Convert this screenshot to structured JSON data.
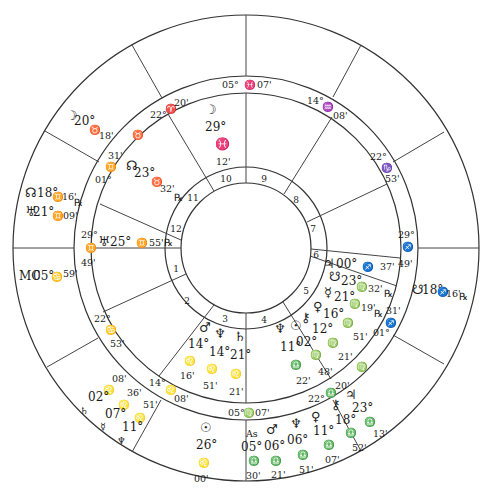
{
  "chart": {
    "center": [
      246,
      248
    ],
    "radii": {
      "outer": 233,
      "sign_ring_outer": 172,
      "sign_ring_inner": 155,
      "house_ring_outer": 81,
      "house_ring_inner": 65
    }
  },
  "outer_cusp_lines": [
    {
      "x1": 246,
      "y1": 15,
      "x2": 246,
      "y2": 76
    },
    {
      "x1": 132,
      "y1": 45,
      "x2": 162,
      "y2": 98
    },
    {
      "x1": 45,
      "y1": 131,
      "x2": 99,
      "y2": 162
    },
    {
      "x1": 13,
      "y1": 248,
      "x2": 74,
      "y2": 248
    },
    {
      "x1": 47,
      "y1": 367,
      "x2": 98,
      "y2": 338
    },
    {
      "x1": 132,
      "y1": 452,
      "x2": 161,
      "y2": 400
    },
    {
      "x1": 246,
      "y1": 481,
      "x2": 246,
      "y2": 420
    },
    {
      "x1": 361,
      "y1": 451,
      "x2": 333,
      "y2": 400
    },
    {
      "x1": 444,
      "y1": 364,
      "x2": 393,
      "y2": 335
    },
    {
      "x1": 479,
      "y1": 248,
      "x2": 418,
      "y2": 248
    },
    {
      "x1": 444,
      "y1": 132,
      "x2": 393,
      "y2": 162
    },
    {
      "x1": 361,
      "y1": 45,
      "x2": 333,
      "y2": 97
    }
  ],
  "inner_cusp_lines": [
    {
      "x1": 246,
      "y1": 93,
      "x2": 246,
      "y2": 183
    },
    {
      "x1": 168,
      "y1": 114,
      "x2": 214,
      "y2": 191
    },
    {
      "x1": 100,
      "y1": 204,
      "x2": 181,
      "y2": 240
    },
    {
      "x1": 91,
      "y1": 248,
      "x2": 181,
      "y2": 248
    },
    {
      "x1": 103,
      "y1": 312,
      "x2": 186,
      "y2": 274
    },
    {
      "x1": 159,
      "y1": 376,
      "x2": 214,
      "y2": 305
    },
    {
      "x1": 246,
      "y1": 403,
      "x2": 246,
      "y2": 313
    },
    {
      "x1": 331,
      "y1": 379,
      "x2": 283,
      "y2": 302
    },
    {
      "x1": 397,
      "y1": 286,
      "x2": 310,
      "y2": 256
    },
    {
      "x1": 400,
      "y1": 258,
      "x2": 311,
      "y2": 249
    },
    {
      "x1": 387,
      "y1": 184,
      "x2": 307,
      "y2": 222
    },
    {
      "x1": 332,
      "y1": 117,
      "x2": 284,
      "y2": 194
    }
  ],
  "house_numbers": [
    {
      "n": "1",
      "x": 176,
      "y": 272
    },
    {
      "n": "2",
      "x": 187,
      "y": 304
    },
    {
      "n": "3",
      "x": 225,
      "y": 322
    },
    {
      "n": "4",
      "x": 264,
      "y": 323
    },
    {
      "n": "5",
      "x": 306,
      "y": 294
    },
    {
      "n": "6",
      "x": 316,
      "y": 258
    },
    {
      "n": "7",
      "x": 313,
      "y": 232
    },
    {
      "n": "8",
      "x": 296,
      "y": 203
    },
    {
      "n": "9",
      "x": 264,
      "y": 182
    },
    {
      "n": "10",
      "x": 226,
      "y": 182
    },
    {
      "n": "11",
      "x": 193,
      "y": 201
    },
    {
      "n": "12",
      "x": 176,
      "y": 232
    }
  ],
  "sign_ring_labels": [
    {
      "t": "05°",
      "x": 222,
      "y": 88,
      "c": "sm"
    },
    {
      "t": "♓",
      "x": 244,
      "y": 88,
      "c": "sm"
    },
    {
      "t": "07'",
      "x": 257,
      "y": 88,
      "c": "sm"
    },
    {
      "t": "14°",
      "x": 307,
      "y": 104,
      "c": "sm"
    },
    {
      "t": "♒",
      "x": 322,
      "y": 110,
      "c": "sm"
    },
    {
      "t": "08'",
      "x": 333,
      "y": 119,
      "c": "sm"
    },
    {
      "t": "22°",
      "x": 370,
      "y": 160,
      "c": "sm"
    },
    {
      "t": "♑",
      "x": 381,
      "y": 171,
      "c": "sm"
    },
    {
      "t": "53'",
      "x": 385,
      "y": 182,
      "c": "sm"
    },
    {
      "t": "29°",
      "x": 398,
      "y": 238,
      "c": "sm"
    },
    {
      "t": "♐",
      "x": 402,
      "y": 250,
      "c": "sm"
    },
    {
      "t": "49'",
      "x": 398,
      "y": 267,
      "c": "sm"
    },
    {
      "t": "31'",
      "x": 386,
      "y": 314,
      "c": "sm"
    },
    {
      "t": "♐",
      "x": 385,
      "y": 326,
      "c": "sm"
    },
    {
      "t": "01°",
      "x": 373,
      "y": 336,
      "c": "sm"
    },
    {
      "t": "20'",
      "x": 335,
      "y": 389,
      "c": "sm"
    },
    {
      "t": "♎",
      "x": 325,
      "y": 396,
      "c": "sm"
    },
    {
      "t": "22°",
      "x": 308,
      "y": 402,
      "c": "sm"
    },
    {
      "t": "05°",
      "x": 228,
      "y": 416,
      "c": "sm"
    },
    {
      "t": "♍",
      "x": 243,
      "y": 416,
      "c": "sm"
    },
    {
      "t": "07'",
      "x": 255,
      "y": 416,
      "c": "sm"
    },
    {
      "t": "14°",
      "x": 149,
      "y": 386,
      "c": "sm"
    },
    {
      "t": "♌",
      "x": 165,
      "y": 393,
      "c": "sm"
    },
    {
      "t": "08'",
      "x": 174,
      "y": 402,
      "c": "sm"
    },
    {
      "t": "22°",
      "x": 94,
      "y": 322,
      "c": "sm"
    },
    {
      "t": "♋",
      "x": 105,
      "y": 333,
      "c": "sm"
    },
    {
      "t": "53'",
      "x": 110,
      "y": 347,
      "c": "sm"
    },
    {
      "t": "29°",
      "x": 81,
      "y": 238,
      "c": "sm"
    },
    {
      "t": "♊",
      "x": 85,
      "y": 251,
      "c": "sm"
    },
    {
      "t": "49'",
      "x": 81,
      "y": 266,
      "c": "sm"
    },
    {
      "t": "31'",
      "x": 108,
      "y": 159,
      "c": "sm"
    },
    {
      "t": "♊",
      "x": 105,
      "y": 170,
      "c": "sm"
    },
    {
      "t": "01°",
      "x": 95,
      "y": 183,
      "c": "sm"
    },
    {
      "t": "♉",
      "x": 132,
      "y": 138,
      "c": "sm"
    },
    {
      "t": "22°",
      "x": 150,
      "y": 118,
      "c": "sm"
    },
    {
      "t": "♈",
      "x": 165,
      "y": 112,
      "c": "sm"
    },
    {
      "t": "20'",
      "x": 174,
      "y": 106,
      "c": "sm"
    }
  ],
  "inner_planets": [
    {
      "t": "☽",
      "x": 205,
      "y": 114,
      "c": "gl"
    },
    {
      "t": "29°",
      "x": 205,
      "y": 131,
      "c": "lbl"
    },
    {
      "t": "♓",
      "x": 215,
      "y": 148,
      "c": "lbl"
    },
    {
      "t": "12'",
      "x": 216,
      "y": 165,
      "c": "sm"
    },
    {
      "t": "☊",
      "x": 126,
      "y": 170,
      "c": "gl"
    },
    {
      "t": "23°",
      "x": 134,
      "y": 177,
      "c": "lbl"
    },
    {
      "t": "♉",
      "x": 151,
      "y": 185,
      "c": "sm"
    },
    {
      "t": "32'",
      "x": 160,
      "y": 192,
      "c": "sm"
    },
    {
      "t": "℞",
      "x": 174,
      "y": 201,
      "c": "sm"
    },
    {
      "t": "♅",
      "x": 98,
      "y": 246,
      "c": "gl"
    },
    {
      "t": "25°",
      "x": 110,
      "y": 246,
      "c": "lbl"
    },
    {
      "t": "♊",
      "x": 136,
      "y": 246,
      "c": "sm"
    },
    {
      "t": "55'",
      "x": 149,
      "y": 246,
      "c": "sm"
    },
    {
      "t": "℞",
      "x": 164,
      "y": 246,
      "c": "sm"
    },
    {
      "t": "♃",
      "x": 323,
      "y": 268,
      "c": "gl"
    },
    {
      "t": "00°",
      "x": 336,
      "y": 268,
      "c": "lbl"
    },
    {
      "t": "♐",
      "x": 362,
      "y": 270,
      "c": "sm"
    },
    {
      "t": "37'",
      "x": 380,
      "y": 270,
      "c": "sm"
    },
    {
      "t": "☋",
      "x": 329,
      "y": 281,
      "c": "gl"
    },
    {
      "t": "23°",
      "x": 341,
      "y": 285,
      "c": "lbl"
    },
    {
      "t": "♍",
      "x": 356,
      "y": 290,
      "c": "sm"
    },
    {
      "t": "32'",
      "x": 368,
      "y": 292,
      "c": "sm"
    },
    {
      "t": "℞",
      "x": 384,
      "y": 297,
      "c": "sm"
    },
    {
      "t": "☿",
      "x": 324,
      "y": 297,
      "c": "gl"
    },
    {
      "t": "21°",
      "x": 334,
      "y": 301,
      "c": "lbl"
    },
    {
      "t": "♍",
      "x": 349,
      "y": 307,
      "c": "sm"
    },
    {
      "t": "19'",
      "x": 361,
      "y": 311,
      "c": "sm"
    },
    {
      "t": "℞",
      "x": 374,
      "y": 317,
      "c": "sm"
    },
    {
      "t": "♀",
      "x": 313,
      "y": 311,
      "c": "gl"
    },
    {
      "t": "16°",
      "x": 323,
      "y": 318,
      "c": "lbl"
    },
    {
      "t": "♍",
      "x": 342,
      "y": 326,
      "c": "sm"
    },
    {
      "t": "51'",
      "x": 353,
      "y": 340,
      "c": "sm"
    },
    {
      "t": "⚷",
      "x": 301,
      "y": 322,
      "c": "gl"
    },
    {
      "t": "12°",
      "x": 312,
      "y": 333,
      "c": "lbl"
    },
    {
      "t": "♍",
      "x": 327,
      "y": 346,
      "c": "sm"
    },
    {
      "t": "21'",
      "x": 338,
      "y": 360,
      "c": "sm"
    },
    {
      "t": "☉",
      "x": 290,
      "y": 330,
      "c": "gl"
    },
    {
      "t": "02°",
      "x": 296,
      "y": 346,
      "c": "lbl"
    },
    {
      "t": "♍",
      "x": 310,
      "y": 358,
      "c": "sm"
    },
    {
      "t": "48'",
      "x": 318,
      "y": 375,
      "c": "sm"
    },
    {
      "t": "♆",
      "x": 274,
      "y": 333,
      "c": "gl"
    },
    {
      "t": "11°",
      "x": 280,
      "y": 351,
      "c": "lbl"
    },
    {
      "t": "♎",
      "x": 290,
      "y": 368,
      "c": "sm"
    },
    {
      "t": "22'",
      "x": 296,
      "y": 384,
      "c": "sm"
    },
    {
      "t": "♍",
      "x": 356,
      "y": 370,
      "c": "sm"
    },
    {
      "t": "♂",
      "x": 199,
      "y": 332,
      "c": "gl"
    },
    {
      "t": "14°",
      "x": 188,
      "y": 348,
      "c": "lbl"
    },
    {
      "t": "♌",
      "x": 184,
      "y": 364,
      "c": "sm"
    },
    {
      "t": "16'",
      "x": 180,
      "y": 379,
      "c": "sm"
    },
    {
      "t": "♆",
      "x": 214,
      "y": 338,
      "c": "gl"
    },
    {
      "t": "14°",
      "x": 209,
      "y": 356,
      "c": "lbl"
    },
    {
      "t": "♌",
      "x": 206,
      "y": 372,
      "c": "sm"
    },
    {
      "t": "51'",
      "x": 203,
      "y": 389,
      "c": "sm"
    },
    {
      "t": "♄",
      "x": 234,
      "y": 341,
      "c": "gl"
    },
    {
      "t": "21°",
      "x": 230,
      "y": 359,
      "c": "lbl"
    },
    {
      "t": "♌",
      "x": 230,
      "y": 377,
      "c": "sm"
    },
    {
      "t": "21'",
      "x": 229,
      "y": 395,
      "c": "sm"
    }
  ],
  "outer_planets": [
    {
      "t": "☽",
      "x": 66,
      "y": 120,
      "c": "gl"
    },
    {
      "t": "20°",
      "x": 74,
      "y": 125,
      "c": "lbl"
    },
    {
      "t": "♉",
      "x": 89,
      "y": 133,
      "c": "sm"
    },
    {
      "t": "18'",
      "x": 99,
      "y": 139,
      "c": "sm"
    },
    {
      "t": "☊",
      "x": 25,
      "y": 197,
      "c": "gl"
    },
    {
      "t": "18°",
      "x": 37,
      "y": 197,
      "c": "lbl"
    },
    {
      "t": "♊",
      "x": 52,
      "y": 200,
      "c": "sm"
    },
    {
      "t": "16'",
      "x": 62,
      "y": 200,
      "c": "sm"
    },
    {
      "t": "℞",
      "x": 74,
      "y": 206,
      "c": "sm"
    },
    {
      "t": "♅",
      "x": 25,
      "y": 216,
      "c": "gl"
    },
    {
      "t": "21°",
      "x": 33,
      "y": 216,
      "c": "lbl"
    },
    {
      "t": "♊",
      "x": 52,
      "y": 219,
      "c": "sm"
    },
    {
      "t": "09'",
      "x": 63,
      "y": 219,
      "c": "sm"
    },
    {
      "t": "MC",
      "x": 19,
      "y": 280,
      "c": "lbl"
    },
    {
      "t": "05°",
      "x": 33,
      "y": 280,
      "c": "lbl"
    },
    {
      "t": "♋",
      "x": 51,
      "y": 280,
      "c": "sm"
    },
    {
      "t": "59'",
      "x": 63,
      "y": 277,
      "c": "sm"
    },
    {
      "t": "☋",
      "x": 412,
      "y": 294,
      "c": "gl"
    },
    {
      "t": "18°",
      "x": 422,
      "y": 294,
      "c": "lbl"
    },
    {
      "t": "♐",
      "x": 437,
      "y": 295,
      "c": "sm"
    },
    {
      "t": "16'",
      "x": 446,
      "y": 297,
      "c": "sm"
    },
    {
      "t": "℞",
      "x": 459,
      "y": 300,
      "c": "sm"
    },
    {
      "t": "08'",
      "x": 112,
      "y": 382,
      "c": "sm"
    },
    {
      "t": "♌",
      "x": 103,
      "y": 393,
      "c": "sm"
    },
    {
      "t": "02°",
      "x": 88,
      "y": 401,
      "c": "lbl"
    },
    {
      "t": "36'",
      "x": 127,
      "y": 396,
      "c": "sm"
    },
    {
      "t": "♄",
      "x": 80,
      "y": 414,
      "c": "sm"
    },
    {
      "t": "♌",
      "x": 118,
      "y": 408,
      "c": "sm"
    },
    {
      "t": "07°",
      "x": 105,
      "y": 418,
      "c": "lbl"
    },
    {
      "t": "51'",
      "x": 143,
      "y": 408,
      "c": "sm"
    },
    {
      "t": "☿",
      "x": 100,
      "y": 430,
      "c": "sm"
    },
    {
      "t": "♌",
      "x": 134,
      "y": 421,
      "c": "sm"
    },
    {
      "t": "11°",
      "x": 122,
      "y": 431,
      "c": "lbl"
    },
    {
      "t": "♆",
      "x": 117,
      "y": 444,
      "c": "sm"
    },
    {
      "t": "☉",
      "x": 200,
      "y": 432,
      "c": "gl"
    },
    {
      "t": "26°",
      "x": 196,
      "y": 449,
      "c": "lbl"
    },
    {
      "t": "♌",
      "x": 198,
      "y": 466,
      "c": "sm"
    },
    {
      "t": "00'",
      "x": 194,
      "y": 482,
      "c": "sm"
    },
    {
      "t": "As",
      "x": 246,
      "y": 437,
      "c": "sm"
    },
    {
      "t": "05°",
      "x": 241,
      "y": 451,
      "c": "lbl"
    },
    {
      "t": "♎",
      "x": 248,
      "y": 464,
      "c": "sm"
    },
    {
      "t": "30'",
      "x": 246,
      "y": 479,
      "c": "sm"
    },
    {
      "t": "♂",
      "x": 266,
      "y": 434,
      "c": "gl"
    },
    {
      "t": "06°",
      "x": 264,
      "y": 450,
      "c": "lbl"
    },
    {
      "t": "♎",
      "x": 270,
      "y": 464,
      "c": "sm"
    },
    {
      "t": "21'",
      "x": 271,
      "y": 478,
      "c": "sm"
    },
    {
      "t": "♆",
      "x": 290,
      "y": 428,
      "c": "gl"
    },
    {
      "t": "06°",
      "x": 287,
      "y": 444,
      "c": "lbl"
    },
    {
      "t": "♎",
      "x": 297,
      "y": 458,
      "c": "sm"
    },
    {
      "t": "51'",
      "x": 299,
      "y": 473,
      "c": "sm"
    },
    {
      "t": "♀",
      "x": 311,
      "y": 421,
      "c": "gl"
    },
    {
      "t": "11°",
      "x": 313,
      "y": 435,
      "c": "lbl"
    },
    {
      "t": "♎",
      "x": 323,
      "y": 448,
      "c": "sm"
    },
    {
      "t": "07'",
      "x": 325,
      "y": 463,
      "c": "sm"
    },
    {
      "t": "⚷",
      "x": 331,
      "y": 409,
      "c": "gl"
    },
    {
      "t": "18°",
      "x": 335,
      "y": 424,
      "c": "lbl"
    },
    {
      "t": "♎",
      "x": 345,
      "y": 436,
      "c": "sm"
    },
    {
      "t": "52'",
      "x": 352,
      "y": 451,
      "c": "sm"
    },
    {
      "t": "♃",
      "x": 345,
      "y": 399,
      "c": "gl"
    },
    {
      "t": "23°",
      "x": 352,
      "y": 412,
      "c": "lbl"
    },
    {
      "t": "♎",
      "x": 364,
      "y": 425,
      "c": "sm"
    },
    {
      "t": "13'",
      "x": 373,
      "y": 437,
      "c": "sm"
    }
  ]
}
